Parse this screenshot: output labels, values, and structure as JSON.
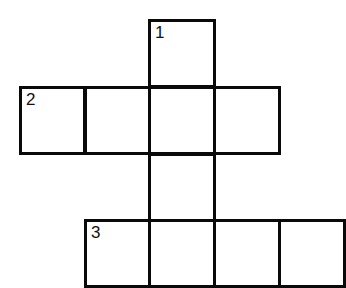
{
  "puzzle": {
    "type": "crossword",
    "border_color": "#0a0a0a",
    "cells": [
      {
        "id": "c1",
        "x": 148,
        "y": 19,
        "w": 68,
        "h": 69,
        "number": "1"
      },
      {
        "id": "c2",
        "x": 19,
        "y": 86,
        "w": 67,
        "h": 69,
        "number": "2"
      },
      {
        "id": "c3",
        "x": 84,
        "y": 86,
        "w": 67,
        "h": 69,
        "number": ""
      },
      {
        "id": "c4",
        "x": 148,
        "y": 86,
        "w": 68,
        "h": 69,
        "number": ""
      },
      {
        "id": "c5",
        "x": 213,
        "y": 86,
        "w": 68,
        "h": 69,
        "number": ""
      },
      {
        "id": "c6",
        "x": 148,
        "y": 153,
        "w": 68,
        "h": 69,
        "number": ""
      },
      {
        "id": "c7",
        "x": 84,
        "y": 219,
        "w": 67,
        "h": 69,
        "number": "3"
      },
      {
        "id": "c8",
        "x": 148,
        "y": 219,
        "w": 68,
        "h": 69,
        "number": ""
      },
      {
        "id": "c9",
        "x": 213,
        "y": 219,
        "w": 68,
        "h": 69,
        "number": ""
      },
      {
        "id": "c10",
        "x": 278,
        "y": 219,
        "w": 68,
        "h": 69,
        "number": ""
      }
    ]
  }
}
